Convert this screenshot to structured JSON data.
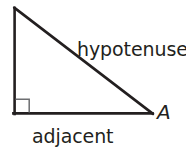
{
  "figure": {
    "name": "right-triangle-diagram",
    "background_color": "#ffffff",
    "stroke_color": "#231f20",
    "right_angle_stroke_color": "#6d6e71",
    "text_color": "#231f20",
    "labels": {
      "hypotenuse": "hypotenuse",
      "adjacent": "adjacent",
      "vertex_a": "A"
    },
    "geometry": {
      "apex": [
        14,
        8
      ],
      "right_angle_vertex": [
        14,
        114
      ],
      "vertex_a": [
        152,
        114
      ],
      "right_angle_marker": [
        15,
        99,
        14,
        14
      ],
      "stroke_width": 2.6,
      "marker_stroke_width": 1.4
    }
  }
}
